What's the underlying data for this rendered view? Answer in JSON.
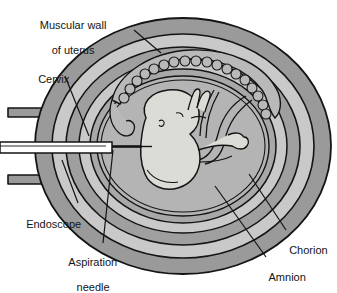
{
  "figure": {
    "type": "medical-anatomical-illustration",
    "background_color": "#ffffff",
    "line_color": "#141414",
    "palette": {
      "myometrium_dark": "#9a9a9a",
      "layer_light": "#c9c9c9",
      "amniotic_fluid": "#b4b4b4",
      "fetus_fill": "#dcdcd6",
      "placenta_fill": "#b9b9b9",
      "instrument_white": "#ffffff",
      "outline": "#141414"
    }
  },
  "labels": [
    {
      "id": "muscular-wall",
      "text": "Muscular wall\nof uterus",
      "lines": [
        "Muscular wall",
        "of uterus"
      ],
      "x": 70,
      "y": 6,
      "align": "center",
      "leader": {
        "x1": 134,
        "y1": 30,
        "x2": 161,
        "y2": 53
      }
    },
    {
      "id": "cervix",
      "text": "Cervix",
      "lines": [
        "Cervix"
      ],
      "x": 38,
      "y": 60,
      "align": "left",
      "leader": {
        "x1": 65,
        "y1": 76,
        "x2": 89,
        "y2": 136
      }
    },
    {
      "id": "endoscope",
      "text": "Endoscope",
      "lines": [
        "Endoscope"
      ],
      "x": 24,
      "y": 205,
      "align": "left",
      "leader": {
        "x1": 78,
        "y1": 203,
        "x2": 62,
        "y2": 160
      }
    },
    {
      "id": "aspiration-needle",
      "text": "Aspiration\nneedle",
      "lines": [
        "Aspiration",
        "needle"
      ],
      "x": 60,
      "y": 246,
      "align": "center",
      "leader": {
        "x1": 103,
        "y1": 243,
        "x2": 113,
        "y2": 150
      }
    },
    {
      "id": "chorion",
      "text": "Chorion",
      "lines": [
        "Chorion"
      ],
      "x": 282,
      "y": 232,
      "align": "left",
      "leader": {
        "x1": 286,
        "y1": 230,
        "x2": 249,
        "y2": 174
      }
    },
    {
      "id": "amnion",
      "text": "Amnion",
      "lines": [
        "Amnion"
      ],
      "x": 262,
      "y": 260,
      "align": "left",
      "leader": {
        "x1": 266,
        "y1": 257,
        "x2": 215,
        "y2": 186
      }
    }
  ],
  "anatomy": [
    {
      "id": "uterus-outer-wall",
      "name": "Muscular wall of uterus (myometrium)"
    },
    {
      "id": "uterine-inner-layer",
      "name": "Inner uterine layer"
    },
    {
      "id": "chorion-membrane",
      "name": "Chorion"
    },
    {
      "id": "amnion-membrane",
      "name": "Amnion"
    },
    {
      "id": "amniotic-cavity",
      "name": "Amniotic cavity"
    },
    {
      "id": "placenta",
      "name": "Placenta"
    },
    {
      "id": "umbilical-cord",
      "name": "Umbilical cord"
    },
    {
      "id": "fetus",
      "name": "Fetus"
    },
    {
      "id": "cervix-canal",
      "name": "Cervix"
    },
    {
      "id": "vagina-wall",
      "name": "Vaginal wall"
    },
    {
      "id": "endoscope-tube",
      "name": "Endoscope"
    },
    {
      "id": "aspiration-needle-shaft",
      "name": "Aspiration needle"
    }
  ]
}
